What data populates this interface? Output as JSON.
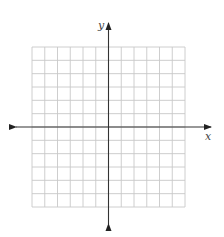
{
  "diagram": {
    "type": "coordinate-plane",
    "axes": {
      "x_label": "x",
      "y_label": "y",
      "arrows_both_ends": true
    },
    "grid": {
      "columns": 12,
      "rows": 12,
      "columns_left_of_y_axis": 6,
      "columns_right_of_y_axis": 6,
      "rows_above_x_axis": 6,
      "rows_below_x_axis": 6
    },
    "colors": {
      "grid_line": "#c8c8c8",
      "axis_line": "#333333",
      "background": "#ffffff"
    }
  }
}
